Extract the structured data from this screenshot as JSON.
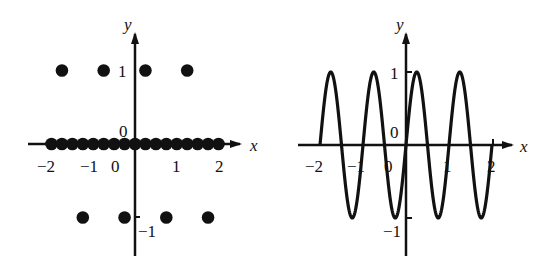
{
  "chart_data": [
    {
      "type": "scatter",
      "title": "",
      "xlabel": "x",
      "ylabel": "y",
      "xlim": [
        -2.4,
        2.6
      ],
      "ylim": [
        -1.6,
        1.6
      ],
      "grid": false,
      "x_tick_labels": [
        "-2",
        "-1",
        "0",
        "1",
        "2"
      ],
      "y_tick_labels": [
        "1",
        "0",
        "-1"
      ],
      "points": [
        {
          "x": -2,
          "y": 0
        },
        {
          "x": -1.75,
          "y": 0
        },
        {
          "x": -1.5,
          "y": 0
        },
        {
          "x": -1.25,
          "y": 0
        },
        {
          "x": -1,
          "y": 0
        },
        {
          "x": -0.75,
          "y": 0
        },
        {
          "x": -0.5,
          "y": 0
        },
        {
          "x": -0.25,
          "y": 0
        },
        {
          "x": 0,
          "y": 0
        },
        {
          "x": 0.25,
          "y": 0
        },
        {
          "x": 0.5,
          "y": 0
        },
        {
          "x": 0.75,
          "y": 0
        },
        {
          "x": 1,
          "y": 0
        },
        {
          "x": 1.25,
          "y": 0
        },
        {
          "x": 1.5,
          "y": 0
        },
        {
          "x": 1.75,
          "y": 0
        },
        {
          "x": 2,
          "y": 0
        },
        {
          "x": -1.75,
          "y": 1
        },
        {
          "x": -0.75,
          "y": 1
        },
        {
          "x": 0.25,
          "y": 1
        },
        {
          "x": 1.25,
          "y": 1
        },
        {
          "x": -1.25,
          "y": -1
        },
        {
          "x": -0.25,
          "y": -1
        },
        {
          "x": 0.75,
          "y": -1
        },
        {
          "x": 1.75,
          "y": -1
        }
      ],
      "axis_points_x": [
        -2,
        -1.5,
        -1,
        -0.5,
        0,
        0.5,
        1,
        1.5,
        2
      ],
      "top_points_x": [
        -1.75,
        -0.75,
        0.25,
        1.25
      ],
      "bottom_points_x": [
        -1.25,
        -0.25,
        0.75,
        1.75
      ]
    },
    {
      "type": "line",
      "title": "",
      "xlabel": "x",
      "ylabel": "y",
      "function": "y = sin(2*pi*x)",
      "xlim": [
        -2.4,
        2.6
      ],
      "ylim": [
        -1.6,
        1.6
      ],
      "domain": [
        -2,
        2
      ],
      "grid": false,
      "x_tick_labels": [
        "-2",
        "-1",
        "0",
        "1",
        "2"
      ],
      "y_tick_labels": [
        "1",
        "0",
        "-1"
      ],
      "peaks_x": [
        -1.75,
        -0.75,
        0.25,
        1.25
      ],
      "troughs_x": [
        -1.25,
        -0.25,
        0.75,
        1.75
      ]
    }
  ],
  "left": {
    "x_axis_label": "x",
    "y_axis_label": "y",
    "origin_label": "0",
    "y_tick_1": "1",
    "y_tick_neg1": "−1",
    "x_ticks": [
      "−2",
      "−1",
      "0",
      "1",
      "2"
    ]
  },
  "right": {
    "x_axis_label": "x",
    "y_axis_label": "y",
    "origin_label": "0",
    "y_tick_1": "1",
    "y_tick_neg1": "−1",
    "x_ticks": [
      "−2",
      "−1",
      "0",
      "1",
      "2"
    ]
  }
}
